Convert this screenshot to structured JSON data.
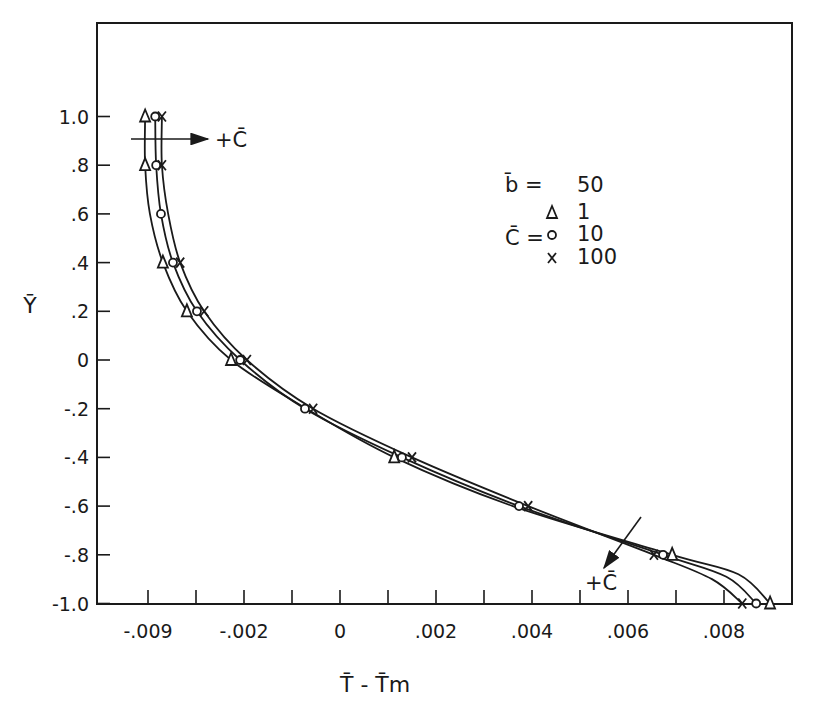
{
  "chart_data": {
    "type": "line",
    "title": "",
    "xlabel": "T̄ - T̄m",
    "ylabel": "Ȳ",
    "xlim": [
      -0.005,
      0.0094
    ],
    "ylim": [
      -1.0,
      1.25
    ],
    "grid": false,
    "x_ticks": [
      {
        "value": -0.004,
        "label": "-.009"
      },
      {
        "value": -0.003,
        "label": ""
      },
      {
        "value": -0.002,
        "label": "-.002"
      },
      {
        "value": -0.001,
        "label": ""
      },
      {
        "value": 0.0,
        "label": "0"
      },
      {
        "value": 0.001,
        "label": ""
      },
      {
        "value": 0.002,
        "label": ".002"
      },
      {
        "value": 0.003,
        "label": ""
      },
      {
        "value": 0.004,
        "label": ".004"
      },
      {
        "value": 0.005,
        "label": ""
      },
      {
        "value": 0.006,
        "label": ".006"
      },
      {
        "value": 0.007,
        "label": ""
      },
      {
        "value": 0.008,
        "label": ".008"
      }
    ],
    "y_ticks": [
      {
        "value": 1.0,
        "label": "1.0"
      },
      {
        "value": 0.8,
        "label": ".8"
      },
      {
        "value": 0.6,
        "label": ".6"
      },
      {
        "value": 0.4,
        "label": ".4"
      },
      {
        "value": 0.2,
        "label": ".2"
      },
      {
        "value": 0.0,
        "label": "0"
      },
      {
        "value": -0.2,
        "label": "-.2"
      },
      {
        "value": -0.4,
        "label": "-.4"
      },
      {
        "value": -0.6,
        "label": "-.6"
      },
      {
        "value": -0.8,
        "label": "-.8"
      },
      {
        "value": -1.0,
        "label": "-1.0"
      }
    ],
    "legend": {
      "position": "upper-right",
      "b_label": "b̄ =",
      "b_value": "50",
      "c_label": "C̄ =",
      "entries": [
        {
          "marker": "triangle",
          "symbol": "Δ",
          "value": "1"
        },
        {
          "marker": "circle",
          "symbol": "o",
          "value": "10"
        },
        {
          "marker": "x",
          "symbol": "x",
          "value": "100"
        }
      ]
    },
    "annotations": [
      {
        "text": "+C̄",
        "arrow": "horizontal-right",
        "near_y": 0.92
      },
      {
        "text": "+C̄",
        "arrow": "diagonal-down-left",
        "near_y": -0.78
      }
    ],
    "series": [
      {
        "name": "C̄ = 1",
        "marker": "triangle",
        "points": [
          {
            "x": -0.00406,
            "y": 1.0
          },
          {
            "x": -0.00406,
            "y": 0.8
          },
          {
            "x": -0.00369,
            "y": 0.4
          },
          {
            "x": -0.00319,
            "y": 0.2
          },
          {
            "x": -0.00227,
            "y": 0.0
          },
          {
            "x": 0.00113,
            "y": -0.4
          },
          {
            "x": 0.00692,
            "y": -0.8
          },
          {
            "x": 0.00896,
            "y": -1.0
          }
        ],
        "curve": [
          [
            -0.00406,
            1.0
          ],
          [
            -0.00406,
            0.8
          ],
          [
            -0.00396,
            0.6
          ],
          [
            -0.00369,
            0.4
          ],
          [
            -0.00319,
            0.2
          ],
          [
            -0.00227,
            0.0
          ],
          [
            -0.0007,
            -0.2
          ],
          [
            0.00113,
            -0.4
          ],
          [
            0.0036,
            -0.6
          ],
          [
            0.00692,
            -0.8
          ],
          [
            0.0083,
            -0.88
          ],
          [
            0.00896,
            -1.0
          ]
        ]
      },
      {
        "name": "C̄ = 10",
        "marker": "circle",
        "points": [
          {
            "x": -0.00385,
            "y": 1.0
          },
          {
            "x": -0.00383,
            "y": 0.8
          },
          {
            "x": -0.00373,
            "y": 0.6
          },
          {
            "x": -0.00348,
            "y": 0.4
          },
          {
            "x": -0.00298,
            "y": 0.2
          },
          {
            "x": -0.00208,
            "y": 0.0
          },
          {
            "x": -0.00073,
            "y": -0.2
          },
          {
            "x": 0.00129,
            "y": -0.4
          },
          {
            "x": 0.00373,
            "y": -0.6
          },
          {
            "x": 0.00673,
            "y": -0.8
          },
          {
            "x": 0.00867,
            "y": -1.0
          }
        ],
        "curve": [
          [
            -0.00385,
            1.0
          ],
          [
            -0.00383,
            0.8
          ],
          [
            -0.00373,
            0.6
          ],
          [
            -0.00348,
            0.4
          ],
          [
            -0.00298,
            0.2
          ],
          [
            -0.00208,
            0.0
          ],
          [
            -0.00073,
            -0.2
          ],
          [
            0.00129,
            -0.4
          ],
          [
            0.00373,
            -0.6
          ],
          [
            0.00673,
            -0.8
          ],
          [
            0.00805,
            -0.89
          ],
          [
            0.00867,
            -1.0
          ]
        ]
      },
      {
        "name": "C̄ = 100",
        "marker": "x",
        "points": [
          {
            "x": -0.00371,
            "y": 1.0
          },
          {
            "x": -0.00371,
            "y": 0.8
          },
          {
            "x": -0.00333,
            "y": 0.4
          },
          {
            "x": -0.00283,
            "y": 0.2
          },
          {
            "x": -0.00194,
            "y": 0.0
          },
          {
            "x": -0.00056,
            "y": -0.2
          },
          {
            "x": 0.0015,
            "y": -0.4
          },
          {
            "x": 0.00392,
            "y": -0.6
          },
          {
            "x": 0.00654,
            "y": -0.8
          },
          {
            "x": 0.00838,
            "y": -1.0
          }
        ],
        "curve": [
          [
            -0.00371,
            1.0
          ],
          [
            -0.00371,
            0.8
          ],
          [
            -0.00358,
            0.6
          ],
          [
            -0.00333,
            0.4
          ],
          [
            -0.00283,
            0.2
          ],
          [
            -0.00194,
            0.0
          ],
          [
            -0.00056,
            -0.2
          ],
          [
            0.0015,
            -0.4
          ],
          [
            0.00392,
            -0.6
          ],
          [
            0.00654,
            -0.8
          ],
          [
            0.00775,
            -0.9
          ],
          [
            0.00838,
            -1.0
          ]
        ]
      }
    ]
  },
  "colors": {
    "ink": "#1a1a1a",
    "background": "#ffffff"
  }
}
